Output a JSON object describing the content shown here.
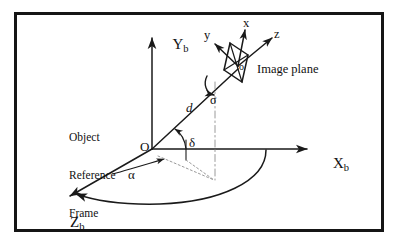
{
  "diagram": {
    "type": "3d-coordinate-geometry-diagram",
    "border_color": "#151515",
    "line_color": "#1a1a1a",
    "background": "#ffffff",
    "caption_block": {
      "line1": "Object",
      "line2": "Reference",
      "line3": "Frame"
    },
    "labels": {
      "image_plane": "Image plane",
      "origin_O": "O",
      "origin_o": "o",
      "distance_d": "d",
      "angle_alpha": "α",
      "angle_delta": "δ",
      "angle_sigma": "σ",
      "axis_Xb_base": "X",
      "axis_Xb_sub": "b",
      "axis_Yb_base": "Y",
      "axis_Yb_sub": "b",
      "axis_Zb_base": "Z",
      "axis_Zb_sub": "b",
      "axis_x": "x",
      "axis_y": "y",
      "axis_z": "z"
    },
    "elements": [
      {
        "name": "body-frame-axis-Xb",
        "kind": "arrow",
        "label": "Xb"
      },
      {
        "name": "body-frame-axis-Yb",
        "kind": "arrow",
        "label": "Yb"
      },
      {
        "name": "body-frame-axis-Zb",
        "kind": "arrow",
        "label": "Zb"
      },
      {
        "name": "line-of-sight-d",
        "kind": "arrow",
        "label": "d"
      },
      {
        "name": "camera-axis-x",
        "kind": "arrow",
        "label": "x"
      },
      {
        "name": "camera-axis-y",
        "kind": "arrow",
        "label": "y"
      },
      {
        "name": "camera-axis-z",
        "kind": "arrow",
        "label": "z"
      },
      {
        "name": "image-plane-parallelogram",
        "kind": "polygon"
      },
      {
        "name": "azimuth-sweep-arc",
        "kind": "arc",
        "label": "α"
      },
      {
        "name": "elevation-angle-arc",
        "kind": "arc",
        "label": "δ"
      },
      {
        "name": "roll-rotation-arc",
        "kind": "arc",
        "label": "σ"
      },
      {
        "name": "projection-dropline",
        "kind": "dash-dot-line"
      },
      {
        "name": "ground-projection-line",
        "kind": "dotted-line"
      }
    ]
  }
}
